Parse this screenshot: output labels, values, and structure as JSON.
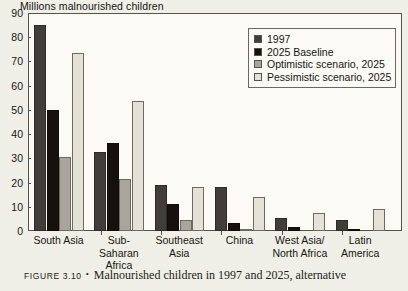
{
  "chart_data": {
    "type": "bar",
    "title": "Millions malnourished children",
    "xlabel": "",
    "ylabel": "Millions malnourished children",
    "ylim": [
      0,
      90
    ],
    "yticks": [
      0,
      10,
      20,
      30,
      40,
      50,
      60,
      70,
      80,
      90
    ],
    "grid": false,
    "legend_position": "top-right",
    "categories": [
      "South Asia",
      "Sub-Saharan Africa",
      "Southeast Asia",
      "China",
      "West Asia/ North Africa",
      "Latin America"
    ],
    "category_lines": [
      [
        "South Asia"
      ],
      [
        "Sub-Saharan",
        "Africa"
      ],
      [
        "Southeast",
        "Asia"
      ],
      [
        "China"
      ],
      [
        "West Asia/",
        "North Africa"
      ],
      [
        "Latin",
        "America"
      ]
    ],
    "series": [
      {
        "name": "1997",
        "color": "#413e39",
        "values": [
          85,
          32.5,
          19,
          18,
          5.5,
          4.5
        ]
      },
      {
        "name": "2025 Baseline",
        "color": "#17110e",
        "values": [
          50,
          36.5,
          11,
          3.5,
          1.5,
          0.5
        ]
      },
      {
        "name": "Optimistic scenario, 2025",
        "color": "#a9a59c",
        "values": [
          30.5,
          21.5,
          4.5,
          1,
          0,
          0
        ]
      },
      {
        "name": "Pessimistic scenario, 2025",
        "color": "#e4e1d7",
        "values": [
          73.5,
          53.5,
          18,
          14,
          7.5,
          9
        ]
      }
    ]
  },
  "legend": {
    "items": [
      {
        "label": "1997"
      },
      {
        "label": "2025 Baseline"
      },
      {
        "label": "Optimistic scenario, 2025"
      },
      {
        "label": "Pessimistic scenario, 2025"
      }
    ]
  },
  "caption": {
    "figure_label": "Figure 3.10",
    "bullet": "•",
    "text": "Malnourished children in 1997 and 2025, alternative"
  }
}
